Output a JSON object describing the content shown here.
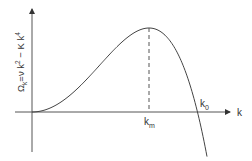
{
  "diagram": {
    "y_axis_label": {
      "omega": "Ω",
      "omega_sub": "k",
      "rest": "=ν k",
      "sq": "2",
      "minus": " − K k",
      "quart": "4"
    },
    "x_axis_label": "k",
    "km_label": {
      "main": "k",
      "sub": "m"
    },
    "k0_label": {
      "main": "k",
      "sub": "0"
    },
    "curve": "Omega_k = nu k^2 - K k^4",
    "colors": {
      "line": "#444444",
      "axis": "#555555"
    }
  }
}
